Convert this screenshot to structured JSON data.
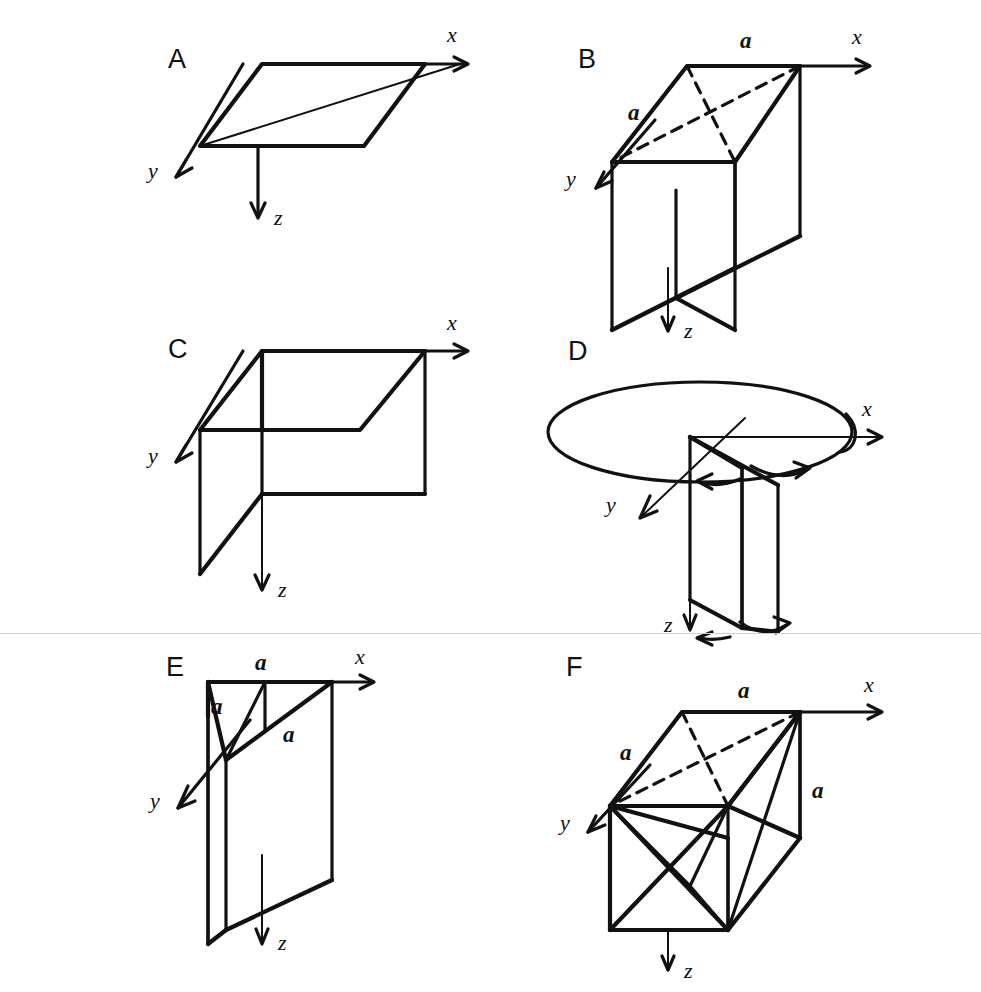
{
  "figure": {
    "type": "line-diagram",
    "background_color": "#ffffff",
    "ink_color": "#111111",
    "divider_color": "#cfcfcf",
    "axis_labels": {
      "x": "x",
      "y": "y",
      "z": "z"
    },
    "dimension_symbol": "a"
  },
  "panels": [
    {
      "id": "A",
      "label": "A",
      "description": "Single horizontal mirror plane shown as a parallelogram in the x-y plane",
      "axes": {
        "x": "x",
        "y": "y",
        "z": "z"
      },
      "dimension_labels": []
    },
    {
      "id": "B",
      "label": "B",
      "description": "Horizontal plane with dashed diagonals plus two intersecting vertical planes",
      "axes": {
        "x": "x",
        "y": "y",
        "z": "z"
      },
      "dimension_labels": [
        "a",
        "a"
      ]
    },
    {
      "id": "C",
      "label": "C",
      "description": "Horizontal plane with two perpendicular vertical planes forming an L",
      "axes": {
        "x": "x",
        "y": "y",
        "z": "z"
      },
      "dimension_labels": []
    },
    {
      "id": "D",
      "label": "D",
      "description": "Circle (rotation axis locus) with two vertical planes and curved rotation arrows",
      "axes": {
        "x": "x",
        "y": "y",
        "z": "z"
      },
      "dimension_labels": []
    },
    {
      "id": "E",
      "label": "E",
      "description": "Vertical planes with diagonal traces marked by equal distances a",
      "axes": {
        "x": "x",
        "y": "y",
        "z": "z"
      },
      "dimension_labels": [
        "a",
        "a",
        "a"
      ]
    },
    {
      "id": "F",
      "label": "F",
      "description": "Cube with dashed top-face diagonals and full set of face diagonals",
      "axes": {
        "x": "x",
        "y": "y",
        "z": "z"
      },
      "dimension_labels": [
        "a",
        "a",
        "a"
      ]
    }
  ]
}
